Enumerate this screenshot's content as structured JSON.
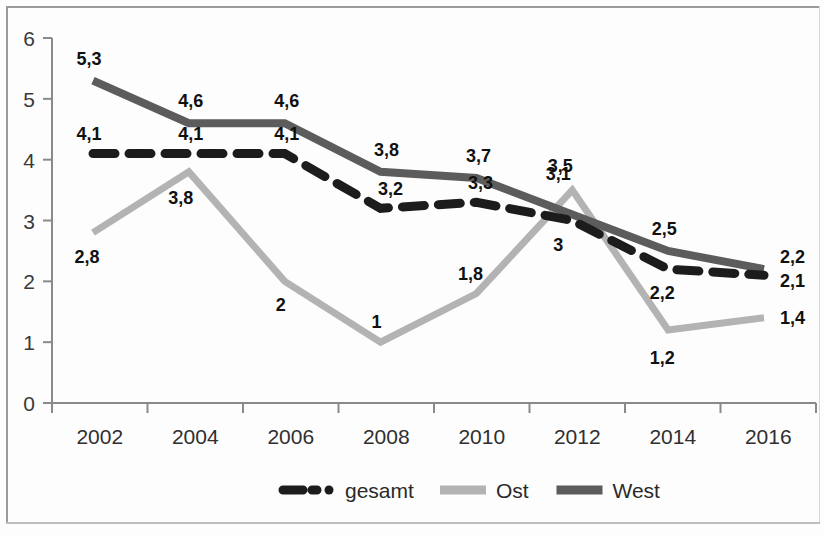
{
  "chart_data": {
    "type": "line",
    "title": "",
    "subtitle": "",
    "xlabel": "",
    "ylabel": "",
    "categories": [
      "2002",
      "2004",
      "2006",
      "2008",
      "2010",
      "2012",
      "2014",
      "2016"
    ],
    "x": [
      2002,
      2004,
      2006,
      2008,
      2010,
      2012,
      2014,
      2016
    ],
    "ylim": [
      0,
      6
    ],
    "xlim": [
      2002,
      2016
    ],
    "y_ticks": [
      "0",
      "1",
      "2",
      "3",
      "4",
      "5",
      "6"
    ],
    "grid": false,
    "legend_position": "bottom",
    "decimal_separator": ",",
    "series": [
      {
        "name": "gesamt",
        "values": [
          4.1,
          4.1,
          4.1,
          3.2,
          3.3,
          3.0,
          2.2,
          2.1
        ],
        "labels": [
          "4,1",
          "4,1",
          "4,1",
          "3,2",
          "3,3",
          "3",
          "2,2",
          "2,1"
        ],
        "color": "#1c1c1c",
        "style": "dashed",
        "width": 9
      },
      {
        "name": "Ost",
        "values": [
          2.8,
          3.8,
          2.0,
          1.0,
          1.8,
          3.5,
          1.2,
          1.4
        ],
        "labels": [
          "2,8",
          "3,8",
          "2",
          "1",
          "1,8",
          "3,5",
          "1,2",
          "1,4"
        ],
        "color": "#b3b3b3",
        "style": "solid",
        "width": 7
      },
      {
        "name": "West",
        "values": [
          5.3,
          4.6,
          4.6,
          3.8,
          3.7,
          3.1,
          2.5,
          2.2
        ],
        "labels": [
          "5,3",
          "4,6",
          "4,6",
          "3,8",
          "3,7",
          "3,1",
          "2,5",
          "2,2"
        ],
        "color": "#5c5c5c",
        "style": "solid",
        "width": 8
      }
    ]
  },
  "legend": {
    "items": [
      {
        "label": "gesamt",
        "color": "#1c1c1c",
        "style": "dashed"
      },
      {
        "label": "Ost",
        "color": "#b3b3b3",
        "style": "solid"
      },
      {
        "label": "West",
        "color": "#5c5c5c",
        "style": "solid"
      }
    ]
  },
  "axes": {
    "y_ticks": [
      "6",
      "5",
      "4",
      "3",
      "2",
      "1",
      "0"
    ],
    "x_ticks": [
      "2002",
      "2004",
      "2006",
      "2008",
      "2010",
      "2012",
      "2014",
      "2016"
    ]
  },
  "label_offsets": {
    "gesamt": [
      {
        "dx": -4,
        "dy": -14
      },
      {
        "dx": 2,
        "dy": -14
      },
      {
        "dx": 2,
        "dy": -14
      },
      {
        "dx": 10,
        "dy": -13
      },
      {
        "dx": 4,
        "dy": -13
      },
      {
        "dx": -14,
        "dy": 30
      },
      {
        "dx": -6,
        "dy": 30
      },
      {
        "dx": 16,
        "dy": 12
      }
    ],
    "Ost": [
      {
        "dx": -6,
        "dy": 30
      },
      {
        "dx": -8,
        "dy": 32
      },
      {
        "dx": -4,
        "dy": 30
      },
      {
        "dx": -4,
        "dy": -14
      },
      {
        "dx": -6,
        "dy": -14
      },
      {
        "dx": -12,
        "dy": -18
      },
      {
        "dx": -6,
        "dy": 34
      },
      {
        "dx": 16,
        "dy": 6
      }
    ],
    "West": [
      {
        "dx": -4,
        "dy": -16
      },
      {
        "dx": 2,
        "dy": -16
      },
      {
        "dx": 2,
        "dy": -16
      },
      {
        "dx": 6,
        "dy": -16
      },
      {
        "dx": 2,
        "dy": -16
      },
      {
        "dx": -14,
        "dy": -34
      },
      {
        "dx": -4,
        "dy": -16
      },
      {
        "dx": 16,
        "dy": -6
      }
    ]
  }
}
